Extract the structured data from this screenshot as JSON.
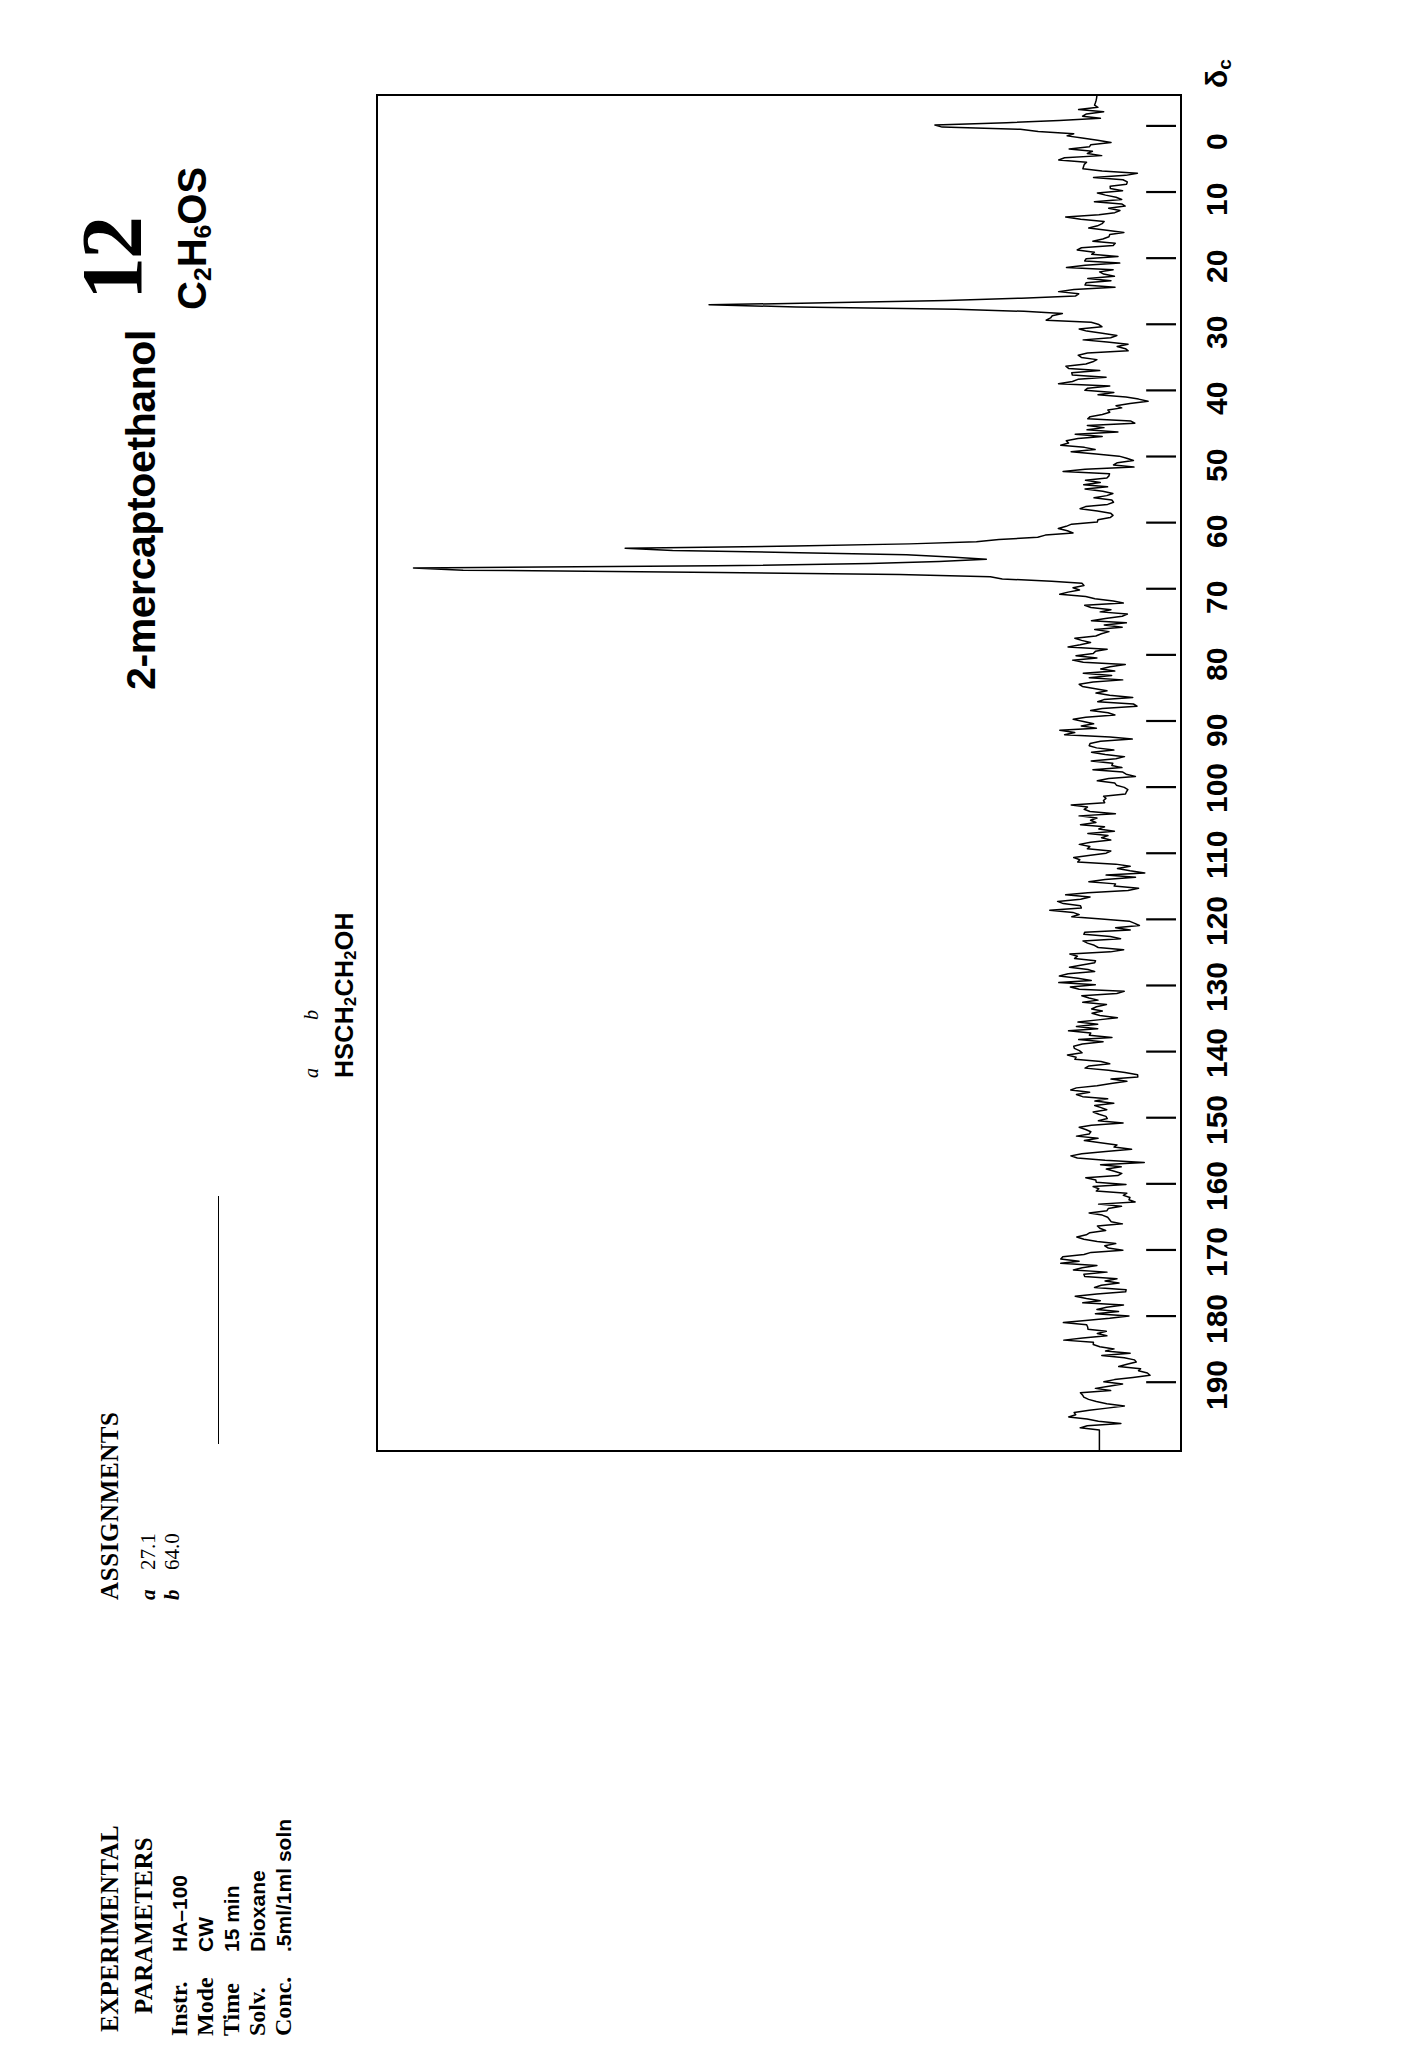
{
  "page": {
    "number": "12",
    "formula_html": "C<sub>2</sub>H<sub>6</sub>OS",
    "formula_text": "C2H6OS",
    "compound_title": "2-mercaptoethanol"
  },
  "structure": {
    "formula_html": "HSCH<sub>2</sub>CH<sub>2</sub>OH",
    "formula_text": "HSCH2CH2OH",
    "label_a": "a",
    "label_b": "b"
  },
  "assignments": {
    "heading": "ASSIGNMENTS",
    "rows": [
      {
        "label": "a",
        "shift": "27.1"
      },
      {
        "label": "b",
        "shift": "64.0"
      }
    ]
  },
  "experimental": {
    "heading_line1": "EXPERIMENTAL",
    "heading_line2": "PARAMETERS",
    "rows": [
      {
        "key": "Instr.",
        "value": "HA–100"
      },
      {
        "key": "Mode",
        "value": "CW"
      },
      {
        "key": "Time",
        "value": "15 min"
      },
      {
        "key": "Solv.",
        "value": "Dioxane"
      },
      {
        "key": "Conc.",
        "value": ".5ml/1ml soln"
      }
    ]
  },
  "axis": {
    "symbol_html": "δ<sub>c</sub>",
    "symbol_text": "delta-c",
    "unit": "ppm",
    "ticks": [
      "0",
      "10",
      "20",
      "30",
      "40",
      "50",
      "60",
      "70",
      "80",
      "90",
      "100",
      "110",
      "120",
      "130",
      "140",
      "150",
      "160",
      "170",
      "180",
      "190"
    ]
  },
  "chart_data": {
    "type": "line",
    "xlabel": "δc (ppm)",
    "ylabel": "intensity",
    "xlim": [
      200,
      -5
    ],
    "grid": false,
    "legend": false,
    "orientation": "chemical-shift axis runs top-to-bottom, 0 ppm at top",
    "peaks": [
      {
        "shift": 0.0,
        "assignment": "TMS reference",
        "rel_height": 0.22,
        "label": ""
      },
      {
        "shift": 27.1,
        "assignment": "a  (HS-CH2-)",
        "rel_height": 0.62,
        "label": "27.1"
      },
      {
        "shift": 64.0,
        "assignment": "b  (-CH2-OH)",
        "rel_height": 0.64,
        "label": "64.0"
      },
      {
        "shift": 67.0,
        "assignment": "Dioxane solvent",
        "rel_height": 1.0,
        "label": ""
      }
    ],
    "baseline_noise": true,
    "noise_amplitude_rel": 0.045
  }
}
